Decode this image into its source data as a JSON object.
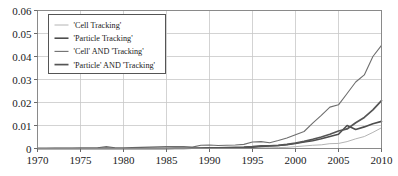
{
  "chart_data": {
    "type": "line",
    "title": "",
    "xlabel": "",
    "ylabel": "",
    "xlim": [
      1970,
      2010
    ],
    "ylim": [
      0,
      0.06
    ],
    "grid": true,
    "legend_position": "top-left",
    "xticks": [
      "1970",
      "1975",
      "1980",
      "1985",
      "1990",
      "1995",
      "2000",
      "2005",
      "2010"
    ],
    "xtick_values": [
      1970,
      1975,
      1980,
      1985,
      1990,
      1995,
      2000,
      2005,
      2010
    ],
    "yticks": [
      "0",
      "0.01",
      "0.02",
      "0.03",
      "0.04",
      "0.05",
      "0.06"
    ],
    "ytick_values": [
      0,
      0.01,
      0.02,
      0.03,
      0.04,
      0.05,
      0.06
    ],
    "x": [
      1970,
      1971,
      1972,
      1973,
      1974,
      1975,
      1976,
      1977,
      1978,
      1979,
      1980,
      1981,
      1982,
      1983,
      1984,
      1985,
      1986,
      1987,
      1988,
      1989,
      1990,
      1991,
      1992,
      1993,
      1994,
      1995,
      1996,
      1997,
      1998,
      1999,
      2000,
      2001,
      2002,
      2003,
      2004,
      2005,
      2006,
      2007,
      2008,
      2009,
      2010
    ],
    "series": [
      {
        "name": "'Cell Tracking'",
        "color": "#b4b4b4",
        "width": 1.0,
        "values": [
          0,
          0,
          0,
          0,
          0,
          0,
          0,
          0,
          0,
          0,
          0,
          0,
          0,
          0,
          0,
          0,
          0,
          0,
          0,
          0,
          0,
          0,
          0,
          0,
          0,
          0,
          0.0002,
          0.0003,
          0.0004,
          0.0005,
          0.0008,
          0.0011,
          0.0014,
          0.0016,
          0.0021,
          0.0022,
          0.003,
          0.0042,
          0.0052,
          0.007,
          0.009
        ]
      },
      {
        "name": "'Particle Tracking'",
        "color": "#4d4d4d",
        "width": 1.6,
        "values": [
          0,
          0,
          0,
          0,
          0,
          0,
          0,
          0,
          0.0001,
          0,
          0,
          0,
          0,
          0,
          0,
          0,
          0,
          0,
          0.0001,
          0.0001,
          0.0002,
          0.0002,
          0.0002,
          0.0003,
          0.0004,
          0.0006,
          0.0009,
          0.0011,
          0.0013,
          0.0016,
          0.0022,
          0.0028,
          0.0034,
          0.0042,
          0.0052,
          0.0062,
          0.01,
          0.0083,
          0.0094,
          0.0108,
          0.0118
        ]
      },
      {
        "name": "'Cell' AND 'Tracking'",
        "color": "#6e6e6e",
        "width": 1.1,
        "values": [
          0,
          0,
          0.0001,
          0.0001,
          0.0001,
          0.0002,
          0.0002,
          0.0003,
          0.0008,
          0.0003,
          0.0002,
          0.0004,
          0.0005,
          0.0006,
          0.0007,
          0.0008,
          0.0008,
          0.0009,
          0.0006,
          0.0014,
          0.0015,
          0.0013,
          0.0014,
          0.0015,
          0.0018,
          0.0028,
          0.003,
          0.0025,
          0.0035,
          0.0046,
          0.006,
          0.0074,
          0.011,
          0.0144,
          0.018,
          0.019,
          0.0239,
          0.0289,
          0.032,
          0.04,
          0.0448
        ]
      },
      {
        "name": "'Particle' AND 'Tracking'",
        "color": "#555555",
        "width": 1.7,
        "values": [
          0,
          0,
          0,
          0,
          0,
          0,
          0,
          0,
          0,
          0,
          0,
          0,
          0,
          0,
          0,
          0,
          0.0001,
          0.0001,
          0.0001,
          0.0002,
          0.0003,
          0.0003,
          0.0004,
          0.0005,
          0.0006,
          0.0008,
          0.0011,
          0.0012,
          0.0014,
          0.0018,
          0.0024,
          0.0031,
          0.004,
          0.005,
          0.0062,
          0.0076,
          0.0085,
          0.0112,
          0.0135,
          0.0168,
          0.0208
        ]
      }
    ]
  },
  "axes": {
    "frame_color": "#8a8a8a",
    "grid_color": "#c8c8c8",
    "tick_color": "#6a6a6a"
  },
  "legend": {
    "background": "#ffffff",
    "border": "#555555",
    "items": [
      {
        "label": "'Cell Tracking'"
      },
      {
        "label": "'Particle Tracking'"
      },
      {
        "label": "'Cell' AND 'Tracking'"
      },
      {
        "label": "'Particle' AND 'Tracking'"
      }
    ]
  }
}
